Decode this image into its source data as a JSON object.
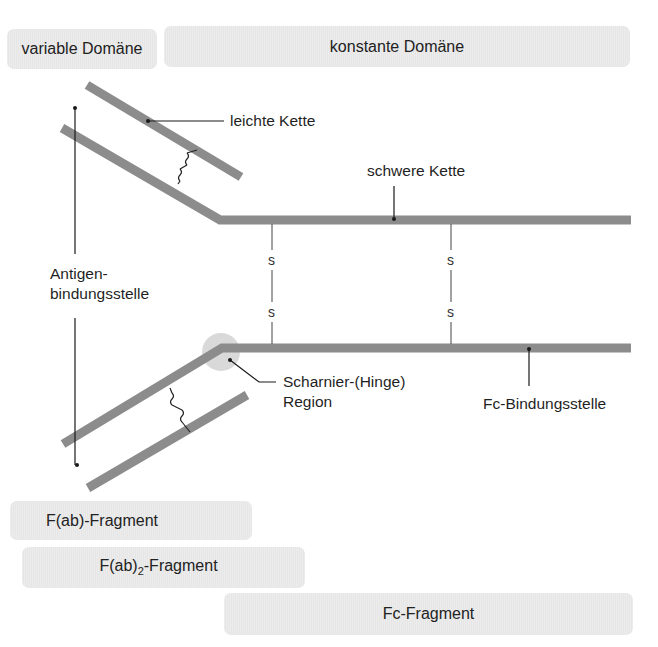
{
  "domains": {
    "variable": "variable Domäne",
    "constant": "konstante Domäne"
  },
  "labels": {
    "light_chain": "leichte Kette",
    "heavy_chain": "schwere Kette",
    "antigen_binding_line1": "Antigen-",
    "antigen_binding_line2": "bindungsstelle",
    "hinge_line1": "Scharnier-(Hinge)",
    "hinge_line2": "Region",
    "fc_binding": "Fc-Bindungsstelle",
    "disulfide": "s"
  },
  "fragments": {
    "fab": "F(ab)-Fragment",
    "fab2_prefix": "F(ab)",
    "fab2_sub": "2",
    "fab2_suffix": "-Fragment",
    "fc": "Fc-Fragment"
  },
  "colors": {
    "chain": "#8c8c8c",
    "box_fill": "#e6e6e6",
    "hinge_circle": "#d9d9d9",
    "line": "#1a1a1a"
  }
}
